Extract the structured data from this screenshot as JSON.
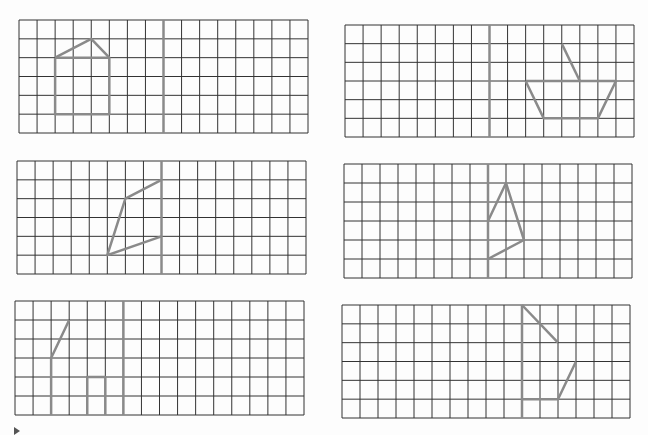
{
  "worksheet": {
    "title": "Symmetry completion grids",
    "colors": {
      "grid_line": "#333333",
      "shape_line": "#8a8a8a",
      "axis_line": "#8a8a8a",
      "paper": "#fdfdfd"
    },
    "grids": [
      {
        "id": "grid-1",
        "x": 19,
        "y": 20,
        "w": 289,
        "h": 113,
        "cols": 16,
        "rows": 6,
        "axis_col": 8,
        "segments": [
          [
            [
              2,
              2
            ],
            [
              4,
              1
            ],
            [
              5,
              2
            ]
          ],
          [
            [
              2,
              2
            ],
            [
              5,
              2
            ],
            [
              5,
              5
            ],
            [
              2,
              5
            ],
            [
              2,
              2
            ]
          ]
        ]
      },
      {
        "id": "grid-2",
        "x": 345,
        "y": 25,
        "w": 289,
        "h": 112,
        "cols": 16,
        "rows": 6,
        "axis_col": 8,
        "segments": [
          [
            [
              12,
              1
            ],
            [
              13,
              3
            ]
          ],
          [
            [
              10,
              3
            ],
            [
              15,
              3
            ],
            [
              14,
              5
            ],
            [
              11,
              5
            ],
            [
              10,
              3
            ]
          ]
        ]
      },
      {
        "id": "grid-3",
        "x": 17,
        "y": 161,
        "w": 289,
        "h": 113,
        "cols": 16,
        "rows": 6,
        "axis_col": 8,
        "segments": [
          [
            [
              8,
              1
            ],
            [
              6,
              2
            ],
            [
              5,
              5
            ],
            [
              8,
              4
            ]
          ]
        ]
      },
      {
        "id": "grid-4",
        "x": 344,
        "y": 164,
        "w": 288,
        "h": 114,
        "cols": 16,
        "rows": 6,
        "axis_col": 8,
        "segments": [
          [
            [
              8,
              3
            ],
            [
              9,
              1
            ],
            [
              10,
              4
            ],
            [
              8,
              5
            ]
          ]
        ]
      },
      {
        "id": "grid-5",
        "x": 15,
        "y": 301,
        "w": 289,
        "h": 114,
        "cols": 16,
        "rows": 6,
        "axis_col": 6,
        "segments": [
          [
            [
              3,
              1
            ],
            [
              2,
              3
            ],
            [
              2,
              6
            ]
          ],
          [
            [
              4,
              6
            ],
            [
              4,
              4
            ],
            [
              5,
              4
            ],
            [
              5,
              6
            ]
          ]
        ]
      },
      {
        "id": "grid-6",
        "x": 342,
        "y": 305,
        "w": 288,
        "h": 113,
        "cols": 16,
        "rows": 6,
        "axis_col": 10,
        "segments": [
          [
            [
              10,
              0
            ],
            [
              12,
              2
            ]
          ],
          [
            [
              13,
              3
            ],
            [
              12,
              5
            ],
            [
              10,
              5
            ]
          ]
        ]
      }
    ]
  }
}
